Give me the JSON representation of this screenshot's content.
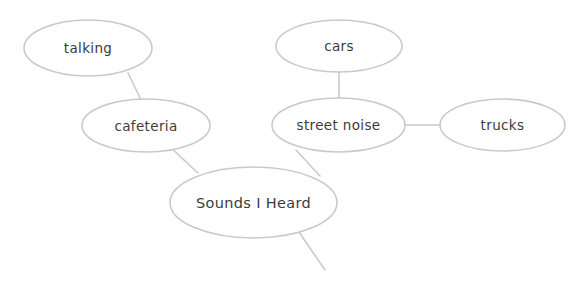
{
  "diagram": {
    "type": "concept-map",
    "title": "Sounds I Heard",
    "background_color": "#ffffff",
    "node_fill_color": "#ffffff",
    "node_stroke_color": "#c9c9c9",
    "edge_stroke_color": "#cacaca",
    "text_color": "#3b3b3b",
    "nodes": [
      {
        "id": "talking",
        "label": "talking",
        "role": "leaf",
        "cx": 88,
        "cy": 48,
        "rx": 64,
        "ry": 28
      },
      {
        "id": "cafeteria",
        "label": "cafeteria",
        "role": "branch",
        "cx": 146,
        "cy": 125.5,
        "rx": 64,
        "ry": 26.5
      },
      {
        "id": "cars",
        "label": "cars",
        "role": "leaf",
        "cx": 339,
        "cy": 46,
        "rx": 63,
        "ry": 26
      },
      {
        "id": "street-noise",
        "label": "street noise",
        "role": "branch",
        "cx": 338.5,
        "cy": 125,
        "rx": 66.5,
        "ry": 27
      },
      {
        "id": "trucks",
        "label": "trucks",
        "role": "leaf",
        "cx": 502.5,
        "cy": 125,
        "rx": 62.5,
        "ry": 26
      },
      {
        "id": "sounds-i-heard",
        "label": "Sounds I Heard",
        "role": "center",
        "cx": 253.5,
        "cy": 202.5,
        "rx": 83.5,
        "ry": 35.5
      }
    ],
    "edges": [
      {
        "id": "edge-talking-cafeteria",
        "from": "talking",
        "to": "cafeteria",
        "x1": 128,
        "y1": 73,
        "x2": 143,
        "y2": 104
      },
      {
        "id": "edge-cafeteria-center",
        "from": "cafeteria",
        "to": "sounds-i-heard",
        "x1": 170,
        "y1": 147,
        "x2": 198,
        "y2": 173
      },
      {
        "id": "edge-cars-street-noise",
        "from": "cars",
        "to": "street-noise",
        "x1": 339,
        "y1": 72,
        "x2": 339,
        "y2": 99
      },
      {
        "id": "edge-street-noise-trucks",
        "from": "street-noise",
        "to": "trucks",
        "x1": 405,
        "y1": 125,
        "x2": 440,
        "y2": 125
      },
      {
        "id": "edge-street-noise-center",
        "from": "street-noise",
        "to": "sounds-i-heard",
        "x1": 296,
        "y1": 150,
        "x2": 320,
        "y2": 176
      },
      {
        "id": "edge-center-unconnected-stub",
        "from": "sounds-i-heard",
        "to": null,
        "x1": 299,
        "y1": 232,
        "x2": 325,
        "y2": 270
      }
    ]
  }
}
